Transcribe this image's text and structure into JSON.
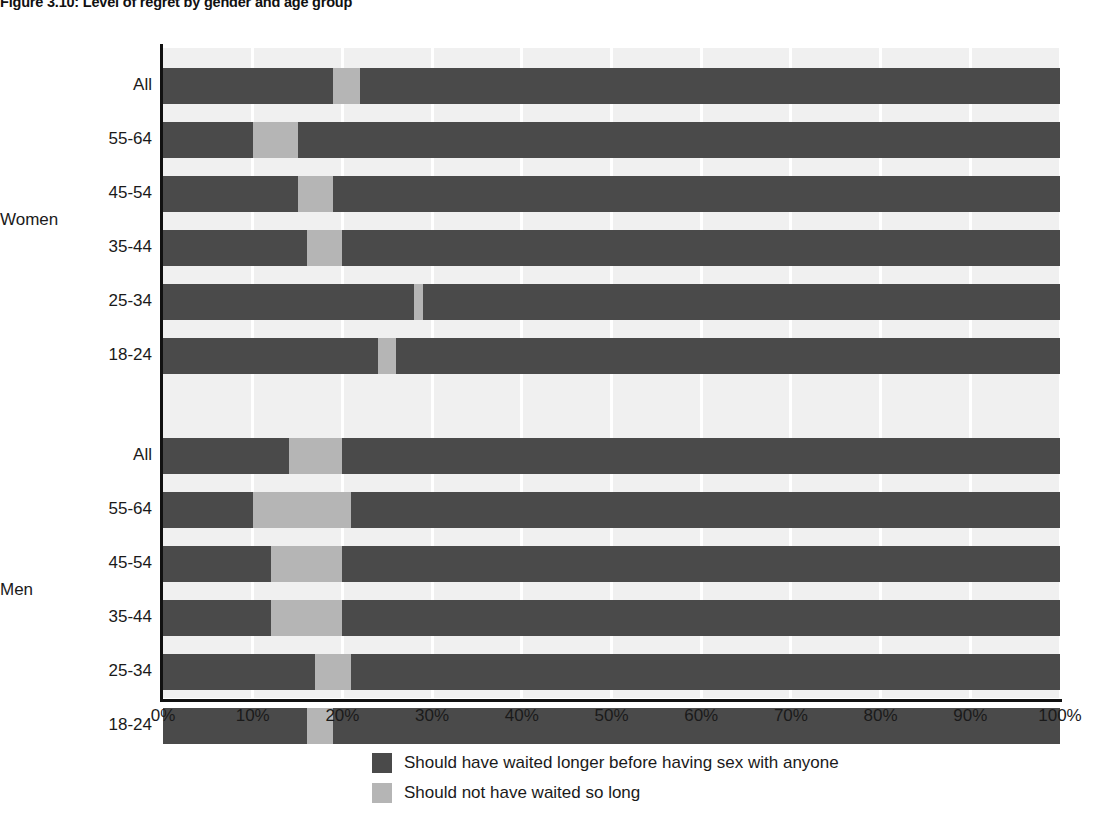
{
  "figure": {
    "title": "Figure 3.10: Level of regret by gender and age group"
  },
  "legend": {
    "position": "bottom-center",
    "items": [
      {
        "label": "Should have waited longer before having sex with anyone",
        "color": "#4a4a4a",
        "key": "waited_longer"
      },
      {
        "label": "Should not have waited so long",
        "color": "#b5b5b5",
        "key": "not_waited_so_long"
      }
    ]
  },
  "axes": {
    "x_ticks": [
      "0%",
      "10%",
      "20%",
      "30%",
      "40%",
      "50%",
      "60%",
      "70%",
      "80%",
      "90%",
      "100%"
    ],
    "group_labels": [
      "Women",
      "Men"
    ]
  },
  "colors": {
    "dark": "#4a4a4a",
    "light": "#b5b5b5",
    "plot_background": "#f0f0f0",
    "gridline": "#ffffff",
    "axis": "#111111",
    "text": "#1a1a1a"
  },
  "chart_data": {
    "type": "bar",
    "orientation": "horizontal",
    "stacked": true,
    "title": "Figure 3.10: Level of regret by gender and age group",
    "xlabel": "",
    "ylabel": "",
    "xlim": [
      0,
      100
    ],
    "x_ticks": [
      0,
      10,
      20,
      30,
      40,
      50,
      60,
      70,
      80,
      90,
      100
    ],
    "grid": true,
    "legend_position": "bottom-center",
    "units": "percent",
    "series": [
      {
        "name": "Should have waited longer before having sex with anyone",
        "color": "#4a4a4a"
      },
      {
        "name": "Should not have waited so long",
        "color": "#b5b5b5"
      },
      {
        "name": "About right",
        "color": "#4a4a4a"
      }
    ],
    "groups": [
      {
        "group": "Women",
        "categories": [
          "All",
          "55-64",
          "45-54",
          "35-44",
          "25-34",
          "18-24"
        ],
        "rows": [
          {
            "category": "All",
            "waited_longer": 19,
            "not_waited_so_long": 3,
            "remainder": 78
          },
          {
            "category": "55-64",
            "waited_longer": 10,
            "not_waited_so_long": 5,
            "remainder": 85
          },
          {
            "category": "45-54",
            "waited_longer": 15,
            "not_waited_so_long": 4,
            "remainder": 81
          },
          {
            "category": "35-44",
            "waited_longer": 16,
            "not_waited_so_long": 4,
            "remainder": 80
          },
          {
            "category": "25-34",
            "waited_longer": 28,
            "not_waited_so_long": 1,
            "remainder": 71
          },
          {
            "category": "18-24",
            "waited_longer": 24,
            "not_waited_so_long": 2,
            "remainder": 74
          }
        ]
      },
      {
        "group": "Men",
        "categories": [
          "All",
          "55-64",
          "45-54",
          "35-44",
          "25-34",
          "18-24"
        ],
        "rows": [
          {
            "category": "All",
            "waited_longer": 14,
            "not_waited_so_long": 6,
            "remainder": 80
          },
          {
            "category": "55-64",
            "waited_longer": 10,
            "not_waited_so_long": 11,
            "remainder": 79
          },
          {
            "category": "45-54",
            "waited_longer": 12,
            "not_waited_so_long": 8,
            "remainder": 80
          },
          {
            "category": "35-44",
            "waited_longer": 12,
            "not_waited_so_long": 8,
            "remainder": 80
          },
          {
            "category": "25-34",
            "waited_longer": 17,
            "not_waited_so_long": 4,
            "remainder": 79
          },
          {
            "category": "18-24",
            "waited_longer": 16,
            "not_waited_so_long": 3,
            "remainder": 81
          }
        ]
      }
    ]
  }
}
